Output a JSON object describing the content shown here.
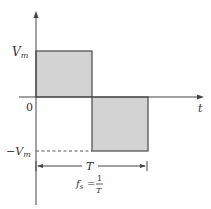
{
  "diagram": {
    "type": "square-wave",
    "labels": {
      "vm": "V",
      "vm_sub": "m",
      "neg_vm": "−V",
      "neg_vm_sub": "m",
      "origin": "0",
      "t_axis": "t",
      "period": "T",
      "formula_f": "f",
      "formula_sub": "s",
      "formula_eq": "=",
      "formula_num": "1",
      "formula_den": "T"
    },
    "colors": {
      "fill": "#d3d3d3",
      "stroke": "#555555",
      "axis": "#444444"
    }
  }
}
